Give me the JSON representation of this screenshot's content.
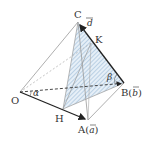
{
  "diagram": {
    "type": "tetrahedron",
    "colors": {
      "edge": "#333333",
      "faint_edge": "#999999",
      "hatch": "#7fa6c9",
      "hatch_fill": "#dbe8f3",
      "vector": "#222222"
    },
    "labels": {
      "C": "C",
      "K": "K",
      "O": "O",
      "H": "H",
      "B": "B(",
      "B_vec": "b",
      "B_close": ")",
      "A": "A(",
      "A_vec": "a",
      "A_close": ")",
      "d_vec": "d",
      "alpha": "α",
      "beta": "β"
    },
    "points": {
      "C": [
        78,
        22
      ],
      "K": [
        91,
        43
      ],
      "O": [
        20,
        92
      ],
      "H": [
        63,
        109
      ],
      "A": [
        88,
        120
      ],
      "B": [
        124,
        83
      ]
    }
  }
}
